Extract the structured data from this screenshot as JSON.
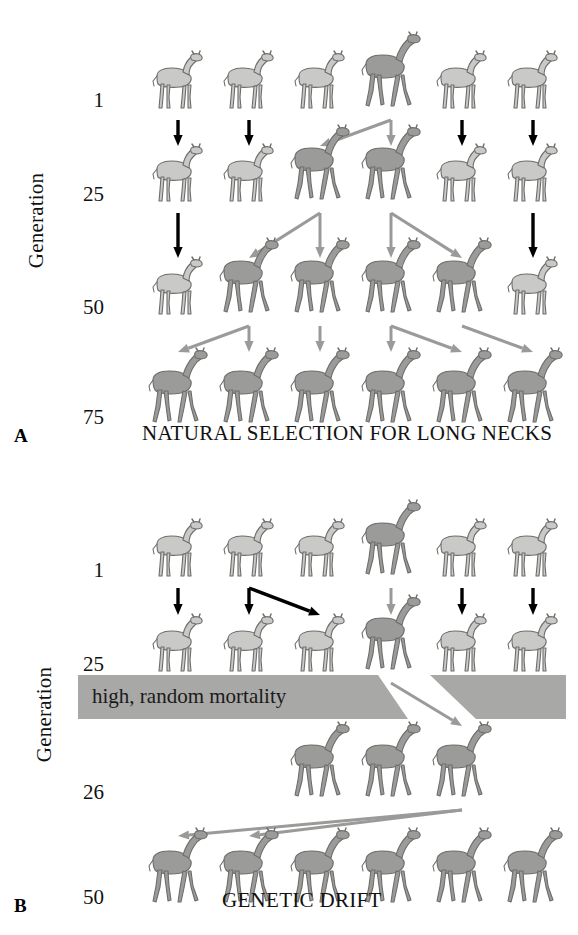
{
  "figure": {
    "background_color": "#ffffff",
    "giraffe_short_color": "#c9c9c7",
    "giraffe_long_color": "#9b9b99",
    "giraffe_outline_color": "#6d6d6b",
    "arrow_black_color": "#000000",
    "arrow_gray_color": "#9a9a98",
    "mortality_band_color": "#a8a8a6"
  },
  "panels": [
    {
      "id": "A",
      "letter": "A",
      "axis_label": "Generation",
      "caption": "NATURAL SELECTION FOR LONG NECKS",
      "generations": [
        "1",
        "25",
        "50",
        "75"
      ],
      "rows": [
        {
          "generation": "1",
          "necks": [
            "short",
            "short",
            "short",
            "long",
            "short",
            "short"
          ]
        },
        {
          "generation": "25",
          "necks": [
            "short",
            "short",
            "long",
            "long",
            "short",
            "short"
          ]
        },
        {
          "generation": "50",
          "necks": [
            "short",
            "long",
            "long",
            "long",
            "long",
            "short"
          ]
        },
        {
          "generation": "75",
          "necks": [
            "long",
            "long",
            "long",
            "long",
            "long",
            "long"
          ]
        }
      ],
      "arrow_groups": [
        {
          "from_generation": "1",
          "to_generation": "25",
          "arrows": [
            {
              "from_col": 1,
              "to_col": 1,
              "color": "black"
            },
            {
              "from_col": 2,
              "to_col": 2,
              "color": "black"
            },
            {
              "from_col": 4,
              "to_col": 3,
              "color": "gray"
            },
            {
              "from_col": 4,
              "to_col": 4,
              "color": "gray"
            },
            {
              "from_col": 5,
              "to_col": 5,
              "color": "black"
            },
            {
              "from_col": 6,
              "to_col": 6,
              "color": "black"
            }
          ]
        },
        {
          "from_generation": "25",
          "to_generation": "50",
          "arrows": [
            {
              "from_col": 1,
              "to_col": 1,
              "color": "black"
            },
            {
              "from_col": 3,
              "to_col": 2,
              "color": "gray"
            },
            {
              "from_col": 3,
              "to_col": 3,
              "color": "gray"
            },
            {
              "from_col": 4,
              "to_col": 4,
              "color": "gray"
            },
            {
              "from_col": 4,
              "to_col": 5,
              "color": "gray"
            },
            {
              "from_col": 6,
              "to_col": 6,
              "color": "black"
            }
          ]
        },
        {
          "from_generation": "50",
          "to_generation": "75",
          "arrows": [
            {
              "from_col": 2,
              "to_col": 1,
              "color": "gray"
            },
            {
              "from_col": 2,
              "to_col": 2,
              "color": "gray"
            },
            {
              "from_col": 3,
              "to_col": 3,
              "color": "gray"
            },
            {
              "from_col": 4,
              "to_col": 4,
              "color": "gray"
            },
            {
              "from_col": 4,
              "to_col": 5,
              "color": "gray"
            },
            {
              "from_col": 5,
              "to_col": 6,
              "color": "gray"
            }
          ]
        }
      ]
    },
    {
      "id": "B",
      "letter": "B",
      "axis_label": "Generation",
      "caption": "GENETIC DRIFT",
      "mortality_label": "high, random mortality",
      "generations": [
        "1",
        "25",
        "26",
        "50"
      ],
      "rows": [
        {
          "generation": "1",
          "necks": [
            "short",
            "short",
            "short",
            "long",
            "short",
            "short"
          ]
        },
        {
          "generation": "25",
          "necks": [
            "short",
            "short",
            "short",
            "long",
            "short",
            "short"
          ]
        },
        {
          "generation": "26",
          "necks": [
            "long",
            "long",
            "long"
          ]
        },
        {
          "generation": "50",
          "necks": [
            "long",
            "long",
            "long",
            "long",
            "long",
            "long"
          ]
        }
      ],
      "arrow_groups": [
        {
          "from_generation": "1",
          "to_generation": "25",
          "arrows": [
            {
              "from_col": 1,
              "to_col": 1,
              "color": "black"
            },
            {
              "from_col": 2,
              "to_col": 2,
              "color": "black"
            },
            {
              "from_col": 2,
              "to_col": 3,
              "color": "black"
            },
            {
              "from_col": 4,
              "to_col": 4,
              "color": "gray"
            },
            {
              "from_col": 5,
              "to_col": 5,
              "color": "black"
            },
            {
              "from_col": 6,
              "to_col": 6,
              "color": "black"
            }
          ]
        },
        {
          "from_generation": "25",
          "to_generation": "26",
          "arrows": [
            {
              "from_col": 4,
              "to_col": 3,
              "color": "gray"
            },
            {
              "from_col": 4,
              "to_col": 4,
              "color": "gray"
            },
            {
              "from_col": 4,
              "to_col": 5,
              "color": "gray"
            }
          ]
        },
        {
          "from_generation": "26",
          "to_generation": "50",
          "arrows": [
            {
              "from_col": 3,
              "to_col": 1,
              "color": "gray"
            },
            {
              "from_col": 3,
              "to_col": 2,
              "color": "gray"
            },
            {
              "from_col": 4,
              "to_col": 3,
              "color": "gray"
            },
            {
              "from_col": 4,
              "to_col": 4,
              "color": "gray"
            },
            {
              "from_col": 5,
              "to_col": 5,
              "color": "gray"
            },
            {
              "from_col": 5,
              "to_col": 6,
              "color": "gray"
            }
          ]
        }
      ]
    }
  ]
}
